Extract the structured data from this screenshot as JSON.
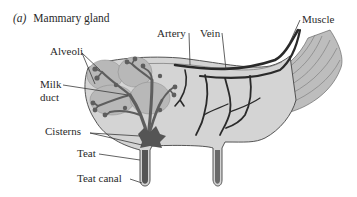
{
  "figure": {
    "panel_letter": "(a)",
    "title": "Mammary gland"
  },
  "labels": {
    "alveoli": "Alveoli",
    "milk_duct_line1": "Milk",
    "milk_duct_line2": "duct",
    "cisterns": "Cisterns",
    "teat": "Teat",
    "teat_canal": "Teat canal",
    "artery": "Artery",
    "vein": "Vein",
    "muscle": "Muscle"
  },
  "colors": {
    "gland_tissue": "#d4d4d4",
    "alveolar_lobe": "#b8b8b8",
    "duct": "#5e5e5e",
    "cistern": "#555555",
    "vessel": "#2a2a2a",
    "muscle": "#9a9a9a",
    "outline": "#444444",
    "text": "#2a2a2a"
  }
}
